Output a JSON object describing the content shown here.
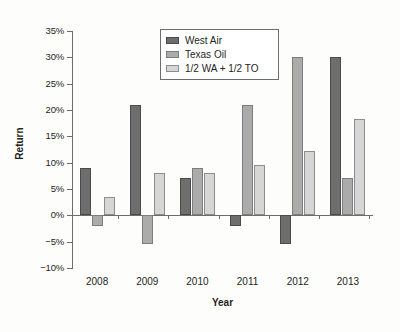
{
  "chart_data": {
    "type": "bar",
    "title": "",
    "xlabel": "Year",
    "ylabel": "Return",
    "categories": [
      "2008",
      "2009",
      "2010",
      "2011",
      "2012",
      "2013"
    ],
    "series": [
      {
        "name": "West Air",
        "color": "#6e6e6e",
        "values": [
          9,
          21,
          7,
          -2,
          -5.5,
          30
        ]
      },
      {
        "name": "Texas Oil",
        "color": "#ababab",
        "values": [
          -2,
          -5.5,
          9,
          21,
          30,
          7
        ]
      },
      {
        "name": "1/2 WA + 1/2 TO",
        "color": "#d6d6d6",
        "values": [
          3.5,
          8,
          8,
          9.5,
          12.3,
          18.3
        ]
      }
    ],
    "ylim": [
      -10,
      35
    ],
    "ytick_step": 5,
    "ytick_labels": [
      "35%",
      "30%",
      "25%",
      "20%",
      "15%",
      "10%",
      "5%",
      "0%",
      "−5%",
      "−10%"
    ],
    "ytick_values": [
      35,
      30,
      25,
      20,
      15,
      10,
      5,
      0,
      -5,
      -10
    ],
    "grid": false,
    "legend_position": "top-center"
  },
  "axes": {
    "y_title": "Return",
    "x_title": "Year"
  },
  "legend": {
    "entries": [
      {
        "label": "West Air",
        "swatch": "dark-gray-swatch"
      },
      {
        "label": "Texas Oil",
        "swatch": "medium-gray-swatch"
      },
      {
        "label": "1/2 WA + 1/2 TO",
        "swatch": "light-gray-swatch"
      }
    ]
  }
}
